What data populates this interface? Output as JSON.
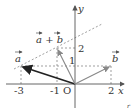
{
  "diagram": {
    "type": "vector-diagram",
    "axes": {
      "x_label": "x",
      "y_label": "y",
      "origin_label": "O"
    },
    "x_ticks": [
      "-3",
      "-1",
      "2"
    ],
    "y_ticks": [
      "1",
      "2"
    ],
    "vectors": [
      {
        "name": "a",
        "label": "a",
        "from": [
          0,
          0
        ],
        "to": [
          -3,
          1
        ],
        "style": "bold"
      },
      {
        "name": "b",
        "label": "b",
        "from": [
          0,
          0
        ],
        "to": [
          2,
          1
        ]
      },
      {
        "name": "a_plus_b",
        "label": "a + b",
        "from": [
          0,
          0
        ],
        "to": [
          -1,
          2
        ]
      }
    ],
    "dashed_line": {
      "through": [
        [
          -3,
          1
        ],
        [
          -1,
          2
        ]
      ]
    },
    "colors": {
      "axis": "#555555",
      "vector_a": "#222222",
      "vector_other": "#888888",
      "dashed": "#777777"
    },
    "corner_mark": "r"
  }
}
